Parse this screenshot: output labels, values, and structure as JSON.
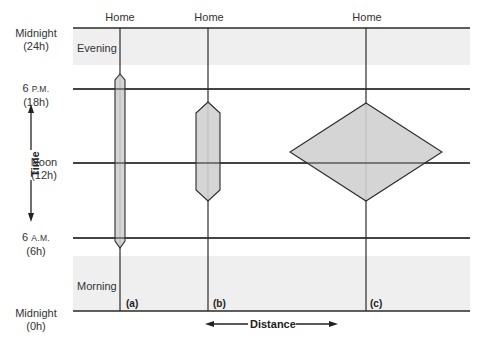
{
  "diagram": {
    "type": "time-geography space-time prisms",
    "y_axis": {
      "title": "Time",
      "ticks": [
        {
          "line1": "Midnight",
          "line2": "(24h)"
        },
        {
          "line1": "6",
          "line1_small": "P.M.",
          "line2": "(18h)"
        },
        {
          "line1": "Noon",
          "line2": "(12h)"
        },
        {
          "line1": "6",
          "line1_small": "A.M.",
          "line2": "(6h)"
        },
        {
          "line1": "Midnight",
          "line2": "(0h)"
        }
      ]
    },
    "x_axis": {
      "title": "Distance"
    },
    "bands": [
      {
        "label": "Evening"
      },
      {
        "label": "Morning"
      }
    ],
    "paths": [
      {
        "id": "a",
        "label": "(a)",
        "top_label": "Home"
      },
      {
        "id": "b",
        "label": "(b)",
        "top_label": "Home"
      },
      {
        "id": "c",
        "label": "(c)",
        "top_label": "Home"
      }
    ],
    "colors": {
      "band": "#efefef",
      "prism_fill": "#d0d0d0",
      "line": "#2a2a2a"
    }
  }
}
